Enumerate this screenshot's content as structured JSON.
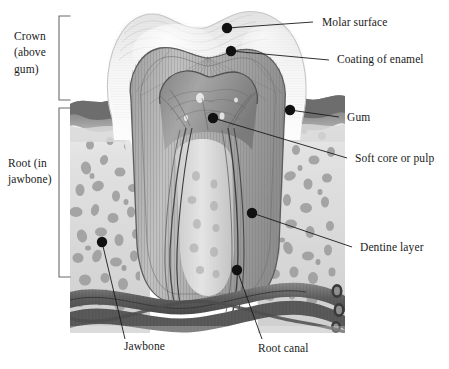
{
  "figure": {
    "background_color": "#ffffff",
    "illustration": {
      "bounds": {
        "x": 70,
        "y": 8,
        "width": 275,
        "height": 325
      },
      "style": "grayscale engraving / airbrush anatomical illustration"
    }
  },
  "brackets": [
    {
      "name": "crown-bracket",
      "label_lines": [
        "Crown",
        "(above",
        "gum)"
      ],
      "label_text": "Crown (above gum)",
      "x": 59,
      "y_top": 16,
      "y_bottom": 100,
      "label_x": 14,
      "label_y": 35
    },
    {
      "name": "root-bracket",
      "label_lines": [
        "Root (in",
        "jawbone)"
      ],
      "label_text": "Root (in jawbone)",
      "x": 59,
      "y_top": 108,
      "y_bottom": 277,
      "label_x": 8,
      "label_y": 163
    }
  ],
  "callouts": [
    {
      "id": "molar-surface",
      "label": "Molar surface",
      "dot": {
        "x": 227,
        "y": 28
      },
      "elbow": {
        "x": 313,
        "y": 22
      },
      "text_anchor": {
        "x": 322,
        "y": 23
      },
      "text_align": "left"
    },
    {
      "id": "coating-of-enamel",
      "label": "Coating of enamel",
      "dot": {
        "x": 231,
        "y": 51
      },
      "elbow": {
        "x": 329,
        "y": 60
      },
      "text_anchor": {
        "x": 337,
        "y": 61
      },
      "text_align": "left"
    },
    {
      "id": "gum",
      "label": "Gum",
      "dot": {
        "x": 290,
        "y": 110
      },
      "elbow": {
        "x": 339,
        "y": 117
      },
      "text_anchor": {
        "x": 347,
        "y": 118
      },
      "text_align": "left"
    },
    {
      "id": "soft-core-or-pulp",
      "label": "Soft core or pulp",
      "dot": {
        "x": 213,
        "y": 118
      },
      "elbow": {
        "x": 347,
        "y": 158
      },
      "text_anchor": {
        "x": 355,
        "y": 159
      },
      "text_align": "left"
    },
    {
      "id": "dentine-layer",
      "label": "Dentine layer",
      "dot": {
        "x": 252,
        "y": 213
      },
      "elbow": {
        "x": 352,
        "y": 247
      },
      "text_anchor": {
        "x": 360,
        "y": 248
      },
      "text_align": "left"
    },
    {
      "id": "jawbone",
      "label": "Jawbone",
      "dot": {
        "x": 102,
        "y": 242
      },
      "elbow": {
        "x": 125,
        "y": 339
      },
      "text_anchor": {
        "x": 124,
        "y": 344
      },
      "text_align": "left"
    },
    {
      "id": "root-canal",
      "label": "Root canal",
      "dot": {
        "x": 237,
        "y": 270
      },
      "elbow": {
        "x": 262,
        "y": 339
      },
      "text_anchor": {
        "x": 258,
        "y": 346
      },
      "text_align": "left"
    }
  ],
  "anatomy_layers": [
    {
      "name": "enamel",
      "tone": "#f2f2f2",
      "description": "outer white coating of crown"
    },
    {
      "name": "dentine",
      "tone": "#b9b9b9",
      "description": "striated layer beneath enamel"
    },
    {
      "name": "pulp",
      "tone": "#8d8d8d",
      "description": "soft core chamber with nerves"
    },
    {
      "name": "gum",
      "tone": "#6e6e6e",
      "description": "dark gingival tissue band"
    },
    {
      "name": "jawbone",
      "tone": "#d8d8d8",
      "description": "porous cancellous bone"
    },
    {
      "name": "nerves_vessels",
      "tone": "#5d5d5d",
      "description": "tubular bundles below root"
    }
  ],
  "colors": {
    "line": "#1a1a1a",
    "dot": "#111111",
    "bracket": "#555555",
    "text": "#1a1a1a",
    "page_background": "#ffffff"
  }
}
